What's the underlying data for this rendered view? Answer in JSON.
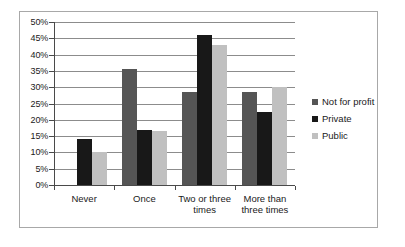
{
  "chart_data": {
    "type": "bar",
    "title": "",
    "subtitle": "",
    "xlabel": "",
    "ylabel": "",
    "ylim": [
      0,
      50
    ],
    "ytick_step": 5,
    "ytick_labels": [
      "50%",
      "45%",
      "40%",
      "35%",
      "30%",
      "25%",
      "20%",
      "15%",
      "10%",
      "5%",
      "0%"
    ],
    "ytick_values": [
      50,
      45,
      40,
      35,
      30,
      25,
      20,
      15,
      10,
      5,
      0
    ],
    "grid": true,
    "legend_position": "right",
    "value_suffix": "%",
    "categories": [
      "Never",
      "Once",
      "Two or three times",
      "More than three times"
    ],
    "series": [
      {
        "name": "Not for profit",
        "color": "#555555",
        "values": [
          0,
          35.5,
          28.5,
          28.5
        ]
      },
      {
        "name": "Private",
        "color": "#181818",
        "values": [
          14,
          17,
          46,
          22.5
        ]
      },
      {
        "name": "Public",
        "color": "#c0c0c0",
        "values": [
          10,
          16.5,
          43,
          30
        ]
      }
    ]
  },
  "legend": {
    "items": [
      {
        "label": "Not for profit",
        "swatch": "#555555"
      },
      {
        "label": "Private",
        "swatch": "#181818"
      },
      {
        "label": "Public",
        "swatch": "#c0c0c0"
      }
    ]
  },
  "axes": {
    "y": {
      "labels": [
        "50%",
        "45%",
        "40%",
        "35%",
        "30%",
        "25%",
        "20%",
        "15%",
        "10%",
        "5%",
        "0%"
      ]
    },
    "x": {
      "labels": [
        "Never",
        "Once",
        "Two or three\ntimes",
        "More than\nthree times"
      ]
    }
  }
}
